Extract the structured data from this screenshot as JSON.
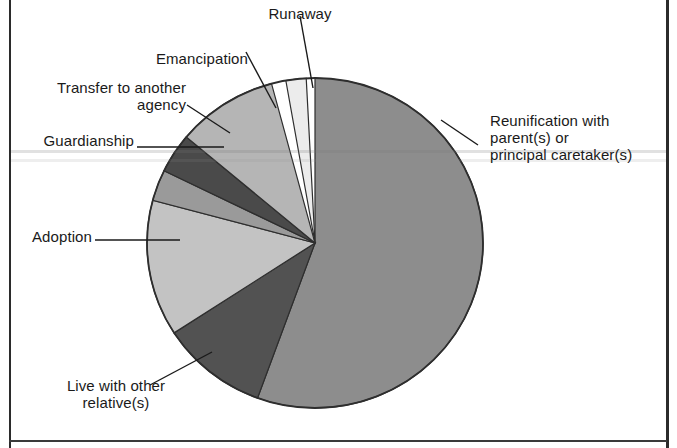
{
  "figure": {
    "type": "pie-chart-figure",
    "background_color": "#ffffff",
    "frame_color": "#2b2b2b"
  },
  "chart_data": {
    "type": "pie",
    "title": "",
    "subtitle": "",
    "xlabel": "",
    "ylabel": "",
    "legend_position": "callout-labels",
    "grid": false,
    "start_angle_deg": 0,
    "direction": "clockwise",
    "categories": [
      "Reunification with parent(s) or principal caretaker(s)",
      "Live with other relative(s)",
      "Adoption",
      "Guardianship",
      "Transfer to another agency",
      "Emancipation",
      "Runaway"
    ],
    "values": [
      55.6,
      10.3,
      13.3,
      3.1,
      3.9,
      9.7,
      4.1
    ],
    "units": "percent",
    "colors": [
      "#8d8d8d",
      "#525252",
      "#c3c3c3",
      "#9a9a9a",
      "#4a4a4a",
      "#b5b5b5",
      "#ececec"
    ],
    "slices": [
      {
        "label": "Reunification with parent(s) or principal caretaker(s)",
        "value": 55.6,
        "start_deg": 0,
        "end_deg": 200,
        "color": "#8d8d8d"
      },
      {
        "label": "Live with other relative(s)",
        "value": 10.3,
        "start_deg": 200,
        "end_deg": 237,
        "color": "#525252"
      },
      {
        "label": "Adoption",
        "value": 13.3,
        "start_deg": 237,
        "end_deg": 285,
        "color": "#c3c3c3"
      },
      {
        "label": "Guardianship",
        "value": 3.1,
        "start_deg": 285,
        "end_deg": 296,
        "color": "#9a9a9a"
      },
      {
        "label": "Transfer to another agency",
        "value": 3.9,
        "start_deg": 296,
        "end_deg": 310,
        "color": "#4a4a4a"
      },
      {
        "label": "Emancipation",
        "value": 9.7,
        "start_deg": 310,
        "end_deg": 345,
        "color": "#b5b5b5"
      },
      {
        "label": "Runaway",
        "value": 4.1,
        "start_deg": 350,
        "end_deg": 357,
        "color": "#ececec"
      }
    ]
  },
  "labels": {
    "runaway": "Runaway",
    "emancipation": "Emancipation",
    "transfer": "Transfer to another\nagency",
    "guardianship": "Guardianship",
    "adoption": "Adoption",
    "live_with_relative": "Live with other\nrelative(s)",
    "reunification": "Reunification with\nparent(s) or\nprincipal caretaker(s)"
  }
}
